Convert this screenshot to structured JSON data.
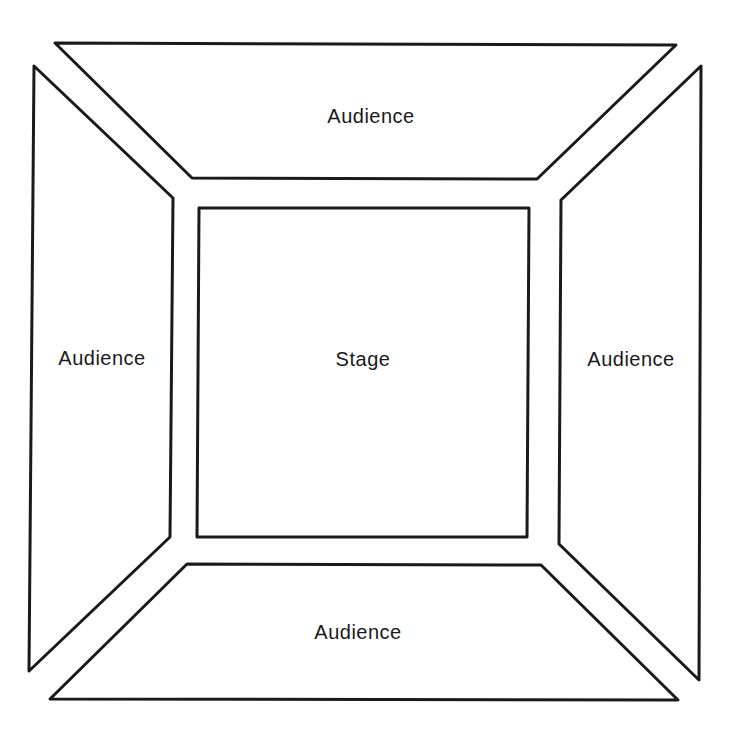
{
  "diagram": {
    "type": "theatre-in-the-round floor plan",
    "stroke_color": "#1a1a1a",
    "background": "#ffffff",
    "stage": {
      "label": "Stage",
      "points": "199,208 529,208 527,537 197,537"
    },
    "audience_top": {
      "label": "Audience",
      "points": "55,43 676,45 537,179 192,178"
    },
    "audience_left": {
      "label": "Audience",
      "points": "34,66 173,198 170,537 29,671"
    },
    "audience_right": {
      "label": "Audience",
      "points": "701,66 699,680 559,544 561,200"
    },
    "audience_bottom": {
      "label": "Audience",
      "points": "187,564 541,565 678,700 50,699"
    }
  }
}
